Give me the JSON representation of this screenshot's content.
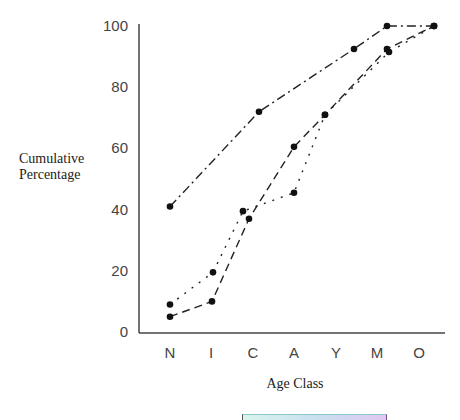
{
  "chart_data": {
    "type": "line",
    "title": "",
    "xlabel": "Age Class",
    "ylabel": "Cumulative Percentage",
    "categories": [
      "N",
      "I",
      "C",
      "A",
      "Y",
      "M",
      "O"
    ],
    "yticks": [
      "0",
      "20",
      "40",
      "60",
      "80",
      "100"
    ],
    "ylim": [
      0,
      100
    ],
    "grid": false,
    "legend": "none visible",
    "series": [
      {
        "name": "Series 1 (dash-dot)",
        "style": "dash-dot",
        "values": [
          41,
          null,
          72,
          null,
          92.5,
          100,
          100
        ]
      },
      {
        "name": "Series 2 (dashed)",
        "style": "dashed",
        "values": [
          5,
          10,
          37,
          60.5,
          71,
          92.5,
          100
        ]
      },
      {
        "name": "Series 3 (dotted)",
        "style": "dotted",
        "values": [
          9,
          19.5,
          39.5,
          45.5,
          71,
          91.5,
          100
        ]
      }
    ]
  },
  "labels": {
    "ylabel_line1": "Cumulative",
    "ylabel_line2": "Percentage",
    "xlabel": "Age Class"
  },
  "colors": {
    "axis": "#444444",
    "line": "#222222",
    "marker": "#111111"
  }
}
